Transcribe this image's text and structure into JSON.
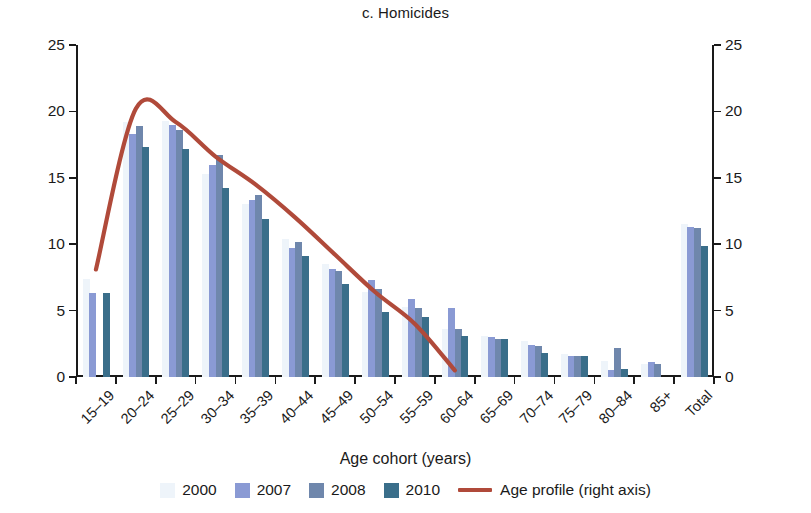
{
  "chart_data": {
    "type": "bar",
    "title": "c. Homicides",
    "xlabel": "Age cohort (years)",
    "ylabel": "Rate (per 100,000 inhabitants)",
    "ylabel_right": "Population-weighted age effects",
    "ylim": [
      0,
      25
    ],
    "ylim_right": [
      0,
      25
    ],
    "yticks": [
      "0",
      "5",
      "10",
      "15",
      "20",
      "25"
    ],
    "ytick_values": [
      0,
      5,
      10,
      15,
      20,
      25
    ],
    "yticks_right": [
      "0",
      "5",
      "10",
      "15",
      "20",
      "25"
    ],
    "grid": false,
    "legend_position": "bottom",
    "categories": [
      "15–19",
      "20–24",
      "25–29",
      "30–34",
      "35–39",
      "40–44",
      "45–49",
      "50–54",
      "55–59",
      "60–64",
      "65–69",
      "70–74",
      "75–79",
      "80–84",
      "85+",
      "Total"
    ],
    "series": [
      {
        "name": "2000",
        "color": "#eef4fa",
        "values": [
          7.4,
          19.2,
          19.3,
          15.3,
          13.0,
          10.4,
          8.5,
          6.4,
          5.3,
          3.6,
          3.1,
          2.7,
          1.7,
          1.2,
          1.0,
          11.5
        ]
      },
      {
        "name": "2007",
        "color": "#8a9ad4",
        "values": [
          6.3,
          18.3,
          19.0,
          16.0,
          13.3,
          9.7,
          8.1,
          7.3,
          5.9,
          5.2,
          3.0,
          2.4,
          1.6,
          0.5,
          1.1,
          11.3
        ]
      },
      {
        "name": "2008",
        "color": "#6f87ac",
        "values": [
          0.0,
          18.9,
          18.6,
          16.7,
          13.7,
          10.2,
          8.0,
          6.6,
          5.2,
          3.6,
          2.9,
          2.3,
          1.6,
          2.2,
          1.0,
          11.2
        ]
      },
      {
        "name": "2010",
        "color": "#3a6e8a",
        "values": [
          6.3,
          17.3,
          17.2,
          14.2,
          11.9,
          9.1,
          7.0,
          4.9,
          4.5,
          3.1,
          2.9,
          1.8,
          1.6,
          0.6,
          0.0,
          9.9
        ]
      }
    ],
    "line_series": {
      "name": "Age profile (right axis)",
      "color": "#b04a3a",
      "x": [
        "15–19",
        "20–24",
        "25–29",
        "30–34",
        "35–39",
        "40–44",
        "45–49",
        "50–54",
        "55–59",
        "60–64"
      ],
      "values": [
        8.1,
        20.2,
        19.2,
        16.6,
        14.5,
        12.0,
        9.2,
        6.4,
        4.0,
        0.5
      ]
    }
  },
  "legend": {
    "items": [
      {
        "label": "2000",
        "color": "#eef4fa",
        "kind": "swatch"
      },
      {
        "label": "2007",
        "color": "#8a9ad4",
        "kind": "swatch"
      },
      {
        "label": "2008",
        "color": "#6f87ac",
        "kind": "swatch"
      },
      {
        "label": "2010",
        "color": "#3a6e8a",
        "kind": "swatch"
      },
      {
        "label": "Age profile (right axis)",
        "color": "#b04a3a",
        "kind": "line"
      }
    ]
  }
}
